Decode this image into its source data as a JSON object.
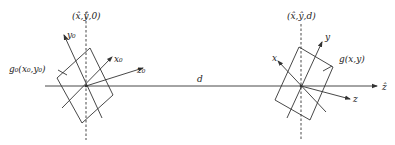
{
  "diagram": {
    "type": "optical-propagation-geometry",
    "axis": {
      "label": "ẑ",
      "distance_label": "d"
    },
    "source_plane": {
      "origin_label": "(x̂,ŷ,0)",
      "field_label": "g₀(x₀,y₀)",
      "axes": {
        "x": "x₀",
        "y": "y₀",
        "z": "z₀"
      }
    },
    "target_plane": {
      "origin_label": "(x̂,ŷ,d)",
      "field_label": "g(x,y)",
      "axes": {
        "x": "x",
        "y": "y",
        "z": "z"
      }
    },
    "colors": {
      "stroke": "#333333",
      "background": "#ffffff"
    }
  }
}
